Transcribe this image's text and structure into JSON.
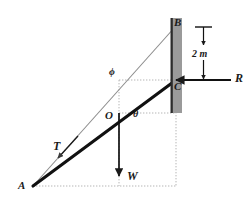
{
  "figure": {
    "kind": "statics-force-diagram",
    "background_color": "#ffffff",
    "line_color": "#1a1a1a",
    "wall_fill_color": "#9a9a9a",
    "wall_edge_color": "#2b2b2b",
    "construction_line_color": "#b5b5b5",
    "thin_line_color": "#8d8d8d"
  },
  "points": {
    "A": {
      "label": "A",
      "x": 32,
      "y": 186
    },
    "B": {
      "label": "B",
      "x": 176,
      "y": 25
    },
    "C": {
      "label": "C",
      "x": 176,
      "y": 80
    },
    "O": {
      "label": "O",
      "x": 112,
      "y": 114
    }
  },
  "vectors": {
    "T": {
      "label": "T",
      "description": "tension-along-thin-cable"
    },
    "W": {
      "label": "W",
      "description": "weight-downward"
    },
    "R": {
      "label": "R",
      "description": "reaction-horizontal-leftward"
    }
  },
  "angles": {
    "phi": {
      "label": "ϕ",
      "description": "angle-of-cable-at-upper-vertex"
    },
    "theta": {
      "label": "θ",
      "description": "angle-of-rod-at-O"
    }
  },
  "dimensions": {
    "height": {
      "label": "2 m",
      "value": 2,
      "unit": "m",
      "description": "distance-B-to-C"
    }
  }
}
